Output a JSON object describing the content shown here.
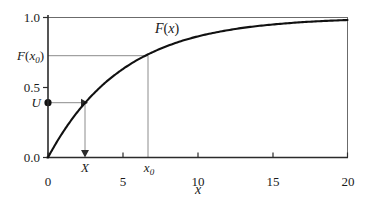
{
  "chart_data": {
    "type": "line",
    "title": "",
    "xlabel": "x",
    "ylabel": "",
    "curve_label": "F(x)",
    "function": "F(x) = 1 - exp(-x/5)",
    "xlim": [
      0,
      20
    ],
    "ylim": [
      0.0,
      1.0
    ],
    "grid": false,
    "legend": "none",
    "x_ticks": [
      {
        "value": 0,
        "label": "0"
      },
      {
        "value": 5,
        "label": "5"
      },
      {
        "value": 10,
        "label": "10"
      },
      {
        "value": 15,
        "label": "15"
      },
      {
        "value": 20,
        "label": "20"
      }
    ],
    "y_ticks": [
      {
        "value": 0.0,
        "label": "0.0"
      },
      {
        "value": 0.5,
        "label": "0.5"
      },
      {
        "value": 1.0,
        "label": "1.0"
      }
    ],
    "x": [
      0,
      0.5,
      1,
      1.5,
      2,
      2.5,
      3,
      3.5,
      4,
      4.5,
      5,
      6,
      6.5,
      7,
      8,
      9,
      10,
      11,
      12,
      13,
      14,
      15,
      16,
      17,
      18,
      19,
      20
    ],
    "series": [
      {
        "name": "F(x)",
        "values": [
          0.0,
          0.095,
          0.181,
          0.259,
          0.33,
          0.393,
          0.451,
          0.503,
          0.551,
          0.593,
          0.632,
          0.699,
          0.727,
          0.753,
          0.798,
          0.835,
          0.865,
          0.889,
          0.909,
          0.926,
          0.939,
          0.95,
          0.959,
          0.967,
          0.973,
          0.978,
          0.982
        ]
      }
    ],
    "annotations": [
      {
        "name": "u-label",
        "label": "U",
        "type": "y-value-label",
        "value": 0.393
      },
      {
        "name": "fx0-label",
        "label": "F(x₀)",
        "value": 0.727
      },
      {
        "name": "x-sample-label",
        "label": "X",
        "value": 2.5
      },
      {
        "name": "x0-label",
        "label": "x₀",
        "value": 6.5
      },
      {
        "name": "u-marker-dot",
        "type": "point",
        "x": 0,
        "y": 0.393
      },
      {
        "name": "inverse-transform-arrow-horizontal",
        "from": [
          0,
          0.393
        ],
        "to": [
          2.5,
          0.393
        ]
      },
      {
        "name": "inverse-transform-arrow-vertical",
        "from": [
          2.5,
          0.393
        ],
        "to": [
          2.5,
          0.0
        ]
      },
      {
        "name": "x0-guide-horizontal",
        "from": [
          0,
          0.727
        ],
        "to": [
          6.5,
          0.727
        ]
      },
      {
        "name": "x0-guide-vertical",
        "from": [
          6.5,
          0.727
        ],
        "to": [
          6.5,
          0.0
        ]
      }
    ]
  },
  "labels": {
    "y": {
      "one": "1.0",
      "half": "0.5",
      "zero": "0.0",
      "fx0_main": "F",
      "fx0_open": "(",
      "fx0_var": "x",
      "fx0_sub": "0",
      "fx0_close": ")",
      "u": "U"
    },
    "x": {
      "t0": "0",
      "t5": "5",
      "t10": "10",
      "t15": "15",
      "t20": "20",
      "sample": "X",
      "x0_var": "x",
      "x0_sub": "0",
      "axis_name": "x"
    },
    "curve": {
      "f_main": "F",
      "open": "(",
      "var": "x",
      "close": ")"
    }
  },
  "colors": {
    "curve": "#111111",
    "axis": "#2b2b2b",
    "frame": "#6b6b6b",
    "guide": "#8c8c8c",
    "text": "#1a1a1a",
    "background": "#ffffff"
  }
}
